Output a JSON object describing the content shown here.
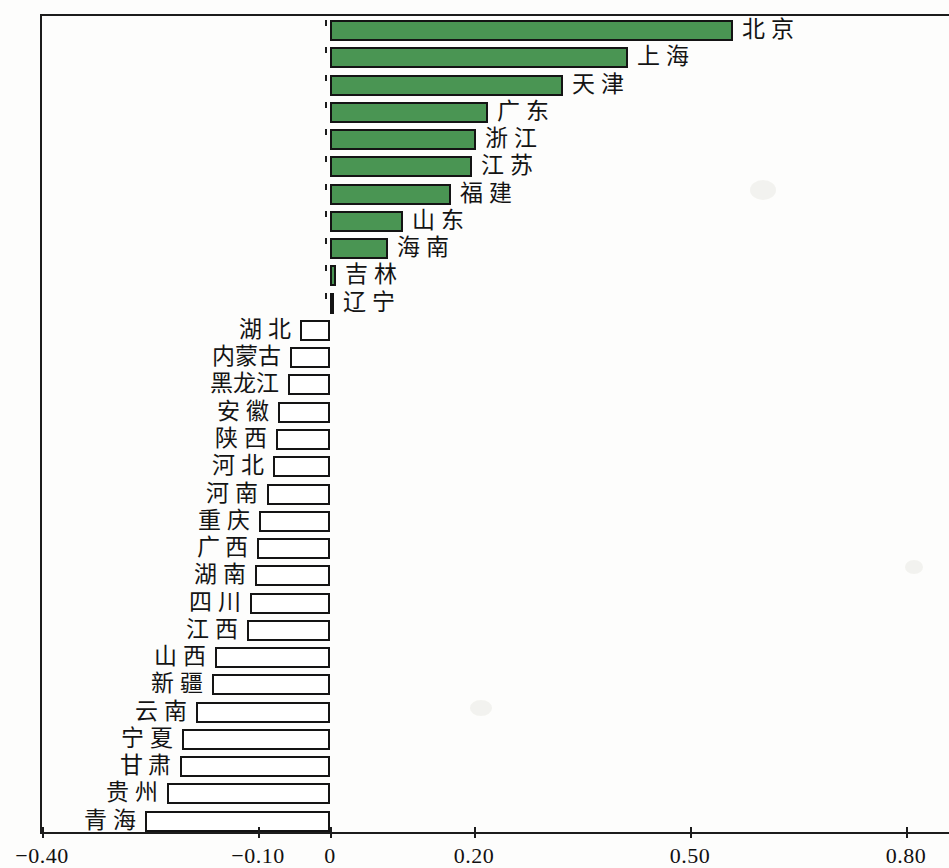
{
  "chart_data": {
    "type": "bar",
    "orientation": "horizontal",
    "title": "",
    "xlabel": "",
    "ylabel": "",
    "xlim": [
      -0.4,
      0.9
    ],
    "grid": false,
    "legend": null,
    "axis_ticks": [
      {
        "label": "-0.40",
        "value": -0.4
      },
      {
        "label": "-0.10",
        "value": -0.1
      },
      {
        "label": "0",
        "value": 0
      },
      {
        "label": "0.20",
        "value": 0.2
      },
      {
        "label": "0.50",
        "value": 0.5
      },
      {
        "label": "0.80",
        "value": 0.8
      }
    ],
    "colors": {
      "positive_bar": "#4a9553",
      "negative_bar": "#ffffff",
      "bar_outline": "#141414",
      "axis": "#1c1c1c",
      "text": "#141414"
    },
    "categories": [
      "北 京",
      "上 海",
      "天 津",
      "广 东",
      "浙 江",
      "江 苏",
      "福 建",
      "山 东",
      "海 南",
      "吉 林",
      "辽 宁",
      "湖 北",
      "内蒙古",
      "黑龙江",
      "安 徽",
      "陕 西",
      "河 北",
      "河 南",
      "重 庆",
      "广 西",
      "湖 南",
      "四 川",
      "江 西",
      "山 西",
      "新 疆",
      "云 南",
      "宁 夏",
      "甘 肃",
      "贵 州",
      "青 海"
    ],
    "values": [
      0.56,
      0.414,
      0.324,
      0.22,
      0.203,
      0.197,
      0.168,
      0.102,
      0.081,
      0.008,
      0.006,
      -0.042,
      -0.056,
      -0.058,
      -0.072,
      -0.075,
      -0.079,
      -0.088,
      -0.099,
      -0.101,
      -0.104,
      -0.111,
      -0.115,
      -0.16,
      -0.164,
      -0.186,
      -0.206,
      -0.208,
      -0.227,
      -0.257
    ]
  }
}
